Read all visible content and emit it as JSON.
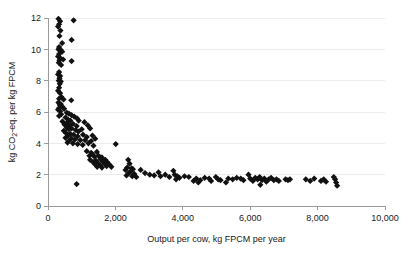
{
  "chart_data": {
    "type": "scatter",
    "title": "",
    "xlabel": "Output per cow, kg FPCM per year",
    "ylabel": "kg CO2-eq. per kg FPCM",
    "ylabel_parts": {
      "pre": "kg CO",
      "sub": "2",
      "post": "-eq. per kg FPCM"
    },
    "xlim": [
      0,
      10000
    ],
    "ylim": [
      0,
      12
    ],
    "xticks": [
      0,
      2000,
      4000,
      6000,
      8000,
      10000
    ],
    "xticklabels": [
      "0",
      "2,000",
      "4,000",
      "6,000",
      "8,000",
      "10,000"
    ],
    "yticks": [
      0,
      2,
      4,
      6,
      8,
      10,
      12
    ],
    "yticklabels": [
      "0",
      "2",
      "4",
      "6",
      "8",
      "10",
      "12"
    ],
    "grid": "horizontal",
    "legend": "none",
    "marker": "diamond",
    "marker_color": "#111111",
    "marker_size": 3.1,
    "series": [
      {
        "name": "farms",
        "points": [
          [
            310,
            11.95
          ],
          [
            360,
            11.8
          ],
          [
            330,
            11.6
          ],
          [
            760,
            11.85
          ],
          [
            300,
            11.45
          ],
          [
            370,
            11.2
          ],
          [
            340,
            10.85
          ],
          [
            420,
            10.4
          ],
          [
            700,
            10.6
          ],
          [
            330,
            10.15
          ],
          [
            310,
            10.0
          ],
          [
            380,
            9.95
          ],
          [
            420,
            9.85
          ],
          [
            330,
            9.7
          ],
          [
            300,
            9.55
          ],
          [
            360,
            9.45
          ],
          [
            340,
            9.3
          ],
          [
            450,
            9.35
          ],
          [
            320,
            9.15
          ],
          [
            390,
            9.0
          ],
          [
            700,
            9.25
          ],
          [
            330,
            8.55
          ],
          [
            300,
            8.4
          ],
          [
            360,
            8.3
          ],
          [
            340,
            8.15
          ],
          [
            320,
            8.0
          ],
          [
            380,
            7.95
          ],
          [
            350,
            7.8
          ],
          [
            330,
            7.55
          ],
          [
            300,
            7.35
          ],
          [
            360,
            7.2
          ],
          [
            400,
            6.95
          ],
          [
            330,
            6.85
          ],
          [
            460,
            6.8
          ],
          [
            690,
            6.75
          ],
          [
            310,
            6.6
          ],
          [
            380,
            6.5
          ],
          [
            350,
            6.45
          ],
          [
            420,
            6.35
          ],
          [
            330,
            6.25
          ],
          [
            300,
            6.15
          ],
          [
            480,
            6.2
          ],
          [
            360,
            6.05
          ],
          [
            560,
            5.95
          ],
          [
            620,
            5.9
          ],
          [
            390,
            5.85
          ],
          [
            330,
            5.75
          ],
          [
            700,
            5.8
          ],
          [
            780,
            5.7
          ],
          [
            520,
            5.65
          ],
          [
            860,
            5.6
          ],
          [
            600,
            5.5
          ],
          [
            660,
            5.45
          ],
          [
            430,
            5.4
          ],
          [
            910,
            5.45
          ],
          [
            560,
            5.3
          ],
          [
            740,
            5.25
          ],
          [
            490,
            5.2
          ],
          [
            640,
            5.15
          ],
          [
            850,
            5.1
          ],
          [
            1080,
            5.35
          ],
          [
            1180,
            5.15
          ],
          [
            560,
            5.0
          ],
          [
            700,
            4.95
          ],
          [
            620,
            4.9
          ],
          [
            820,
            4.85
          ],
          [
            470,
            4.8
          ],
          [
            900,
            4.75
          ],
          [
            1000,
            4.9
          ],
          [
            1250,
            4.95
          ],
          [
            540,
            4.65
          ],
          [
            660,
            4.6
          ],
          [
            760,
            4.55
          ],
          [
            600,
            4.5
          ],
          [
            880,
            4.45
          ],
          [
            1040,
            4.55
          ],
          [
            1150,
            4.4
          ],
          [
            1320,
            4.5
          ],
          [
            520,
            4.35
          ],
          [
            690,
            4.3
          ],
          [
            800,
            4.25
          ],
          [
            960,
            4.2
          ],
          [
            620,
            4.15
          ],
          [
            1100,
            4.2
          ],
          [
            1280,
            4.15
          ],
          [
            1400,
            4.3
          ],
          [
            580,
            4.05
          ],
          [
            740,
            4.0
          ],
          [
            880,
            3.95
          ],
          [
            1030,
            3.9
          ],
          [
            1200,
            4.0
          ],
          [
            1350,
            3.85
          ],
          [
            2010,
            3.95
          ],
          [
            1150,
            3.5
          ],
          [
            1280,
            3.4
          ],
          [
            1320,
            3.3
          ],
          [
            1450,
            3.45
          ],
          [
            1230,
            3.2
          ],
          [
            1380,
            3.15
          ],
          [
            1500,
            3.2
          ],
          [
            1600,
            3.1
          ],
          [
            1250,
            2.95
          ],
          [
            1420,
            2.9
          ],
          [
            1560,
            3.0
          ],
          [
            1700,
            2.95
          ],
          [
            1340,
            2.8
          ],
          [
            1480,
            2.75
          ],
          [
            1620,
            2.85
          ],
          [
            1760,
            2.8
          ],
          [
            1400,
            2.65
          ],
          [
            1550,
            2.6
          ],
          [
            1680,
            2.7
          ],
          [
            1820,
            2.65
          ],
          [
            1460,
            2.5
          ],
          [
            1600,
            2.45
          ],
          [
            1740,
            2.55
          ],
          [
            1880,
            2.5
          ],
          [
            850,
            1.4
          ],
          [
            2380,
            2.95
          ],
          [
            2420,
            2.7
          ],
          [
            2350,
            2.45
          ],
          [
            2480,
            2.4
          ],
          [
            2300,
            2.3
          ],
          [
            2450,
            2.2
          ],
          [
            2520,
            2.35
          ],
          [
            2400,
            2.1
          ],
          [
            2330,
            1.95
          ],
          [
            2500,
            1.9
          ],
          [
            2560,
            2.05
          ],
          [
            2620,
            1.85
          ],
          [
            2750,
            2.3
          ],
          [
            2880,
            2.1
          ],
          [
            3020,
            2.0
          ],
          [
            3150,
            1.95
          ],
          [
            3280,
            2.15
          ],
          [
            3340,
            1.9
          ],
          [
            3480,
            2.0
          ],
          [
            3600,
            1.85
          ],
          [
            3720,
            2.25
          ],
          [
            3760,
            2.0
          ],
          [
            3840,
            1.9
          ],
          [
            3800,
            1.7
          ],
          [
            3900,
            1.8
          ],
          [
            4050,
            1.9
          ],
          [
            4180,
            1.85
          ],
          [
            4320,
            1.6
          ],
          [
            4400,
            1.75
          ],
          [
            4460,
            1.5
          ],
          [
            4520,
            1.65
          ],
          [
            4650,
            1.8
          ],
          [
            4780,
            1.75
          ],
          [
            4840,
            1.6
          ],
          [
            4980,
            1.85
          ],
          [
            5050,
            1.7
          ],
          [
            5120,
            1.65
          ],
          [
            5280,
            1.5
          ],
          [
            5350,
            1.75
          ],
          [
            5480,
            1.7
          ],
          [
            5600,
            1.8
          ],
          [
            5720,
            1.75
          ],
          [
            5800,
            1.65
          ],
          [
            5950,
            2.0
          ],
          [
            6000,
            1.75
          ],
          [
            6080,
            1.6
          ],
          [
            6150,
            1.8
          ],
          [
            6220,
            1.7
          ],
          [
            6280,
            1.85
          ],
          [
            6350,
            1.65
          ],
          [
            6420,
            1.75
          ],
          [
            6480,
            1.55
          ],
          [
            6300,
            1.35
          ],
          [
            6550,
            1.7
          ],
          [
            6620,
            1.8
          ],
          [
            6700,
            1.65
          ],
          [
            6780,
            1.7
          ],
          [
            6850,
            1.6
          ],
          [
            7050,
            1.7
          ],
          [
            7120,
            1.65
          ],
          [
            7180,
            1.7
          ],
          [
            7650,
            1.7
          ],
          [
            7780,
            1.6
          ],
          [
            7900,
            1.75
          ],
          [
            8100,
            1.6
          ],
          [
            8180,
            1.7
          ],
          [
            8250,
            1.55
          ],
          [
            8480,
            1.85
          ],
          [
            8520,
            1.7
          ],
          [
            8550,
            1.5
          ],
          [
            8580,
            1.3
          ]
        ]
      }
    ]
  }
}
